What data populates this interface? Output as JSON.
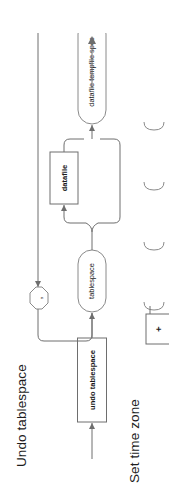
{
  "page": {
    "width": 169,
    "height": 489,
    "background": "#ffffff",
    "line_color": "#6e6e6e",
    "text_color": "#1a1a1a",
    "orientation": "rotated-90-ccw"
  },
  "sections": [
    {
      "id": "undo-tablespace",
      "heading": "Undo tablespace",
      "diagram": {
        "type": "railroad-syntax-diagram",
        "nodes": [
          {
            "id": "undo-tablespace-kw",
            "label": "undo tablespace",
            "kind": "terminal"
          },
          {
            "id": "tablespace-ref",
            "label": "tablespace",
            "kind": "nonterminal"
          },
          {
            "id": "datafile-kw",
            "label": "datafile",
            "kind": "terminal",
            "optional": true
          },
          {
            "id": "datafile-spec",
            "label": "datafile tempfile spec",
            "kind": "nonterminal"
          },
          {
            "id": "comma-sep",
            "label": ",",
            "kind": "separator-octagon"
          }
        ],
        "edges": [
          {
            "from": "entry",
            "to": "undo-tablespace-kw"
          },
          {
            "from": "undo-tablespace-kw",
            "to": "tablespace-ref"
          },
          {
            "from": "tablespace-ref",
            "to": "datafile-kw"
          },
          {
            "from": "tablespace-ref",
            "to": "datafile-spec",
            "kind": "bypass"
          },
          {
            "from": "datafile-kw",
            "to": "datafile-spec"
          },
          {
            "from": "datafile-spec",
            "to": "exit"
          },
          {
            "from": "datafile-spec",
            "to": "comma-sep",
            "kind": "loop-back"
          },
          {
            "from": "comma-sep",
            "to": "datafile-spec",
            "kind": "loop-back"
          }
        ]
      }
    },
    {
      "id": "set-time-zone",
      "heading": "Set time zone",
      "clipped": true,
      "diagram": {
        "type": "railroad-syntax-diagram",
        "nodes": [
          {
            "id": "plus-sign",
            "label": "+",
            "kind": "terminal"
          },
          {
            "id": "clipped-1",
            "label": "",
            "kind": "nonterminal-clipped"
          },
          {
            "id": "clipped-2",
            "label": "",
            "kind": "nonterminal-clipped"
          },
          {
            "id": "clipped-3",
            "label": "",
            "kind": "nonterminal-clipped"
          },
          {
            "id": "clipped-4",
            "label": "",
            "kind": "nonterminal-clipped"
          }
        ]
      }
    }
  ]
}
